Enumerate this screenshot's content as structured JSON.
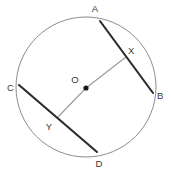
{
  "figure": {
    "background_color": "#ffffff",
    "width": 171,
    "height": 173
  },
  "circle": {
    "name": "circle-outline",
    "center_x": 86,
    "center_y": 87,
    "radius": 70,
    "stroke_color": "#8c8c8c",
    "stroke_width": 1,
    "fill": "none"
  },
  "center_point": {
    "label": "O",
    "x": 86,
    "y": 88,
    "dot_radius": 2.6,
    "dot_color": "#1a1a1a",
    "label_x": 75,
    "label_y": 83
  },
  "chords": [
    {
      "id": "chord-ab",
      "label": "AB",
      "x1": 100,
      "y1": 21,
      "x2": 153,
      "y2": 93,
      "stroke_color": "#2b2b2b",
      "stroke_width": 2.1,
      "endpoints": [
        {
          "label": "A",
          "x": 100,
          "y": 21,
          "label_x": 95,
          "label_y": 12
        },
        {
          "label": "B",
          "x": 153,
          "y": 93,
          "label_x": 157,
          "label_y": 99
        }
      ],
      "midpoint": {
        "label": "X",
        "x": 126,
        "y": 57,
        "label_x": 128,
        "label_y": 54
      }
    },
    {
      "id": "chord-cd",
      "label": "CD",
      "x1": 19,
      "y1": 85,
      "x2": 97,
      "y2": 152,
      "stroke_color": "#2b2b2b",
      "stroke_width": 2.1,
      "endpoints": [
        {
          "label": "C",
          "x": 19,
          "y": 85,
          "label_x": 7,
          "label_y": 91
        },
        {
          "label": "D",
          "x": 97,
          "y": 152,
          "label_x": 99,
          "label_y": 167
        }
      ],
      "midpoint": {
        "label": "Y",
        "x": 57,
        "y": 118,
        "label_x": 49,
        "label_y": 130
      }
    }
  ],
  "radii": [
    {
      "id": "radius-ox",
      "from": "O",
      "to": "X",
      "x1": 86,
      "y1": 88,
      "x2": 126,
      "y2": 57,
      "stroke_color": "#9a9a9a",
      "stroke_width": 1.1
    },
    {
      "id": "radius-oy",
      "from": "O",
      "to": "Y",
      "x1": 86,
      "y1": 88,
      "x2": 57,
      "y2": 118,
      "stroke_color": "#9a9a9a",
      "stroke_width": 1.1
    }
  ],
  "labels": {
    "a": "A",
    "b": "B",
    "c": "C",
    "d": "D",
    "o": "O",
    "x": "X",
    "y": "Y"
  }
}
